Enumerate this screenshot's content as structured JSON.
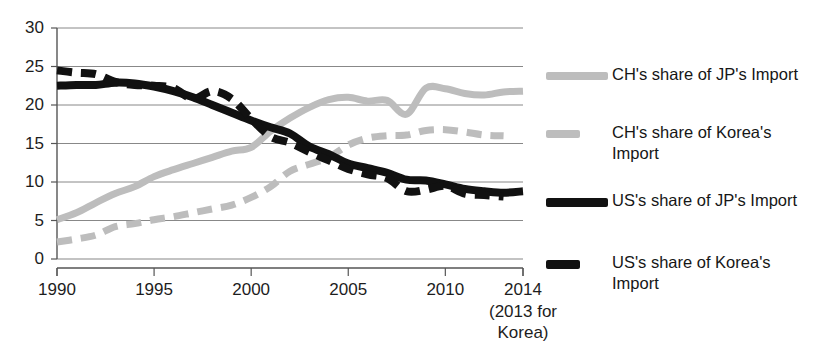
{
  "chart_data": {
    "type": "line",
    "title": "",
    "subtitle": "",
    "xlabel": "",
    "ylabel": "",
    "xlim": [
      1990,
      2014
    ],
    "ylim": [
      0,
      30
    ],
    "ytick_values": [
      30,
      25,
      20,
      15,
      10,
      5,
      0
    ],
    "ytick_labels": [
      "30",
      "25",
      "20",
      "15",
      "10",
      "5",
      "0"
    ],
    "xtick_values": [
      1990,
      1995,
      2000,
      2005,
      2010,
      2014
    ],
    "xtick_labels": [
      "1990",
      "1995",
      "2000",
      "2005",
      "2010",
      "2014"
    ],
    "xtick_note": "(2013 for\nKorea)",
    "grid": "horizontal",
    "legend_position": "right",
    "series": [
      {
        "name": "CH's share of JP's Import",
        "color": "#bdbdbd",
        "style": "solid",
        "width": 7,
        "x": [
          1990,
          1991,
          1992,
          1993,
          1994,
          1995,
          1996,
          1997,
          1998,
          1999,
          2000,
          2001,
          2002,
          2003,
          2004,
          2005,
          2006,
          2007,
          2008,
          2009,
          2010,
          2011,
          2012,
          2013,
          2014
        ],
        "values": [
          5.1,
          6.0,
          7.3,
          8.5,
          9.4,
          10.7,
          11.6,
          12.4,
          13.2,
          14.0,
          14.5,
          16.6,
          18.3,
          19.7,
          20.7,
          21.0,
          20.5,
          20.6,
          18.8,
          22.2,
          22.1,
          21.5,
          21.3,
          21.7,
          21.8
        ]
      },
      {
        "name": "CH's share of Korea's Import",
        "color": "#bdbdbd",
        "style": "dashed",
        "width": 7,
        "x": [
          1990,
          1991,
          1992,
          1993,
          1994,
          1995,
          1996,
          1997,
          1998,
          1999,
          2000,
          2001,
          2002,
          2003,
          2004,
          2005,
          2006,
          2007,
          2008,
          2009,
          2010,
          2011,
          2012,
          2013
        ],
        "values": [
          2.2,
          2.6,
          3.1,
          4.2,
          4.6,
          5.1,
          5.5,
          6.0,
          6.5,
          7.0,
          8.0,
          9.4,
          11.4,
          12.3,
          13.2,
          14.8,
          15.7,
          16.0,
          16.1,
          16.7,
          16.8,
          16.5,
          16.1,
          16.0
        ]
      },
      {
        "name": "US's share of JP's Import",
        "color": "#111111",
        "style": "solid",
        "width": 8,
        "x": [
          1990,
          1991,
          1992,
          1993,
          1994,
          1995,
          1996,
          1997,
          1998,
          1999,
          2000,
          2001,
          2002,
          2003,
          2004,
          2005,
          2006,
          2007,
          2008,
          2009,
          2010,
          2011,
          2012,
          2013,
          2014
        ],
        "values": [
          22.5,
          22.6,
          22.6,
          22.9,
          22.8,
          22.4,
          21.8,
          21.0,
          20.0,
          19.0,
          18.0,
          17.1,
          16.3,
          14.6,
          13.6,
          12.4,
          11.8,
          11.2,
          10.3,
          10.2,
          9.7,
          9.1,
          8.8,
          8.6,
          8.8
        ]
      },
      {
        "name": "US's share of Korea's Import",
        "color": "#111111",
        "style": "dashed",
        "width": 8,
        "x": [
          1990,
          1991,
          1992,
          1993,
          1994,
          1995,
          1996,
          1997,
          1998,
          1999,
          2000,
          2001,
          2002,
          2003,
          2004,
          2005,
          2006,
          2007,
          2008,
          2009,
          2010,
          2011,
          2012,
          2013
        ],
        "values": [
          24.5,
          24.2,
          24.0,
          23.0,
          22.6,
          22.5,
          22.2,
          20.8,
          21.8,
          20.8,
          18.2,
          15.9,
          15.1,
          13.9,
          12.8,
          11.7,
          11.0,
          10.5,
          8.8,
          9.0,
          9.5,
          8.5,
          8.3,
          8.1
        ]
      }
    ]
  },
  "legend": {
    "items": [
      {
        "label": "CH's share of JP's Import",
        "color": "#bdbdbd",
        "style": "solid"
      },
      {
        "label": "CH's share of Korea's\nImport",
        "color": "#bdbdbd",
        "style": "dashed"
      },
      {
        "label": "US's share of JP's Import",
        "color": "#111111",
        "style": "solid"
      },
      {
        "label": "US's share of Korea's\nImport",
        "color": "#111111",
        "style": "dashed"
      }
    ]
  },
  "axis": {
    "y_labels": [
      "30",
      "25",
      "20",
      "15",
      "10",
      "5",
      "0"
    ],
    "x_labels": [
      "1990",
      "1995",
      "2000",
      "2005",
      "2010",
      "2014"
    ],
    "x_note_line1": "(2013 for",
    "x_note_line2": "Korea)"
  },
  "colors": {
    "gray_series": "#bdbdbd",
    "black_series": "#111111",
    "gridline": "#888888",
    "axis": "#555555",
    "text": "#1a1a1a"
  }
}
